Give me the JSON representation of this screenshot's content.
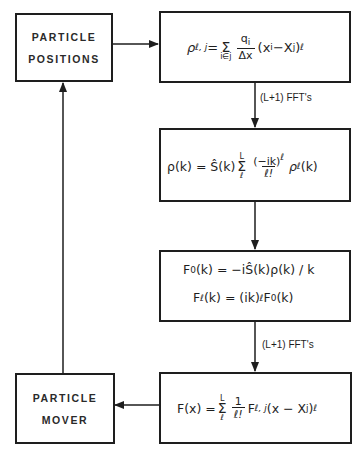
{
  "diagram": {
    "nodes": {
      "particle_positions": {
        "line1": "PARTICLE",
        "line2": "POSITIONS"
      },
      "particle_mover": {
        "line1": "PARTICLE",
        "line2": "MOVER"
      },
      "charge_moments": {
        "lhs": "ρ",
        "lhs_sub": "ℓ, j",
        "eq": " =",
        "sum_lower": "i∈j",
        "frac_num": "q",
        "frac_num_sub": "i",
        "frac_den": "Δx",
        "tail": "(x",
        "tail_sub1": "i",
        "tail_mid": "−X",
        "tail_sub2": "j",
        "tail_end": ")",
        "tail_sup": "ℓ"
      },
      "density_k": {
        "lhs": "ρ(k) = Ŝ(k)",
        "sum_upper": "L",
        "sum_lower": "ℓ",
        "frac_num": "(−ik)",
        "frac_num_sup": "ℓ",
        "frac_den": "ℓ!",
        "tail": "ρ",
        "tail_sub": "ℓ",
        "tail_end": " (k)"
      },
      "field_k": {
        "line1_a": "F",
        "line1_sub": "0",
        "line1_b": "(k) = −iŜ(k)ρ(k) / k",
        "line2_a": "F",
        "line2_sub": "ℓ",
        "line2_b": "(k) = (ik)",
        "line2_sup": "ℓ",
        "line2_c": "F",
        "line2_sub2": "0",
        "line2_d": "(k)"
      },
      "field_x": {
        "lhs": "F(x) =",
        "sum_upper": "L",
        "sum_lower": "ℓ",
        "frac_num": "1",
        "frac_den": "ℓ!",
        "tail_a": "F",
        "tail_sub": "ℓ, j",
        "tail_b": "(x − X",
        "tail_sub2": "j",
        "tail_c": ")",
        "tail_sup": "ℓ"
      }
    },
    "edges": {
      "fft_label_1": "(L+1) FFT's",
      "fft_label_2": "(L+1) FFT's"
    }
  }
}
